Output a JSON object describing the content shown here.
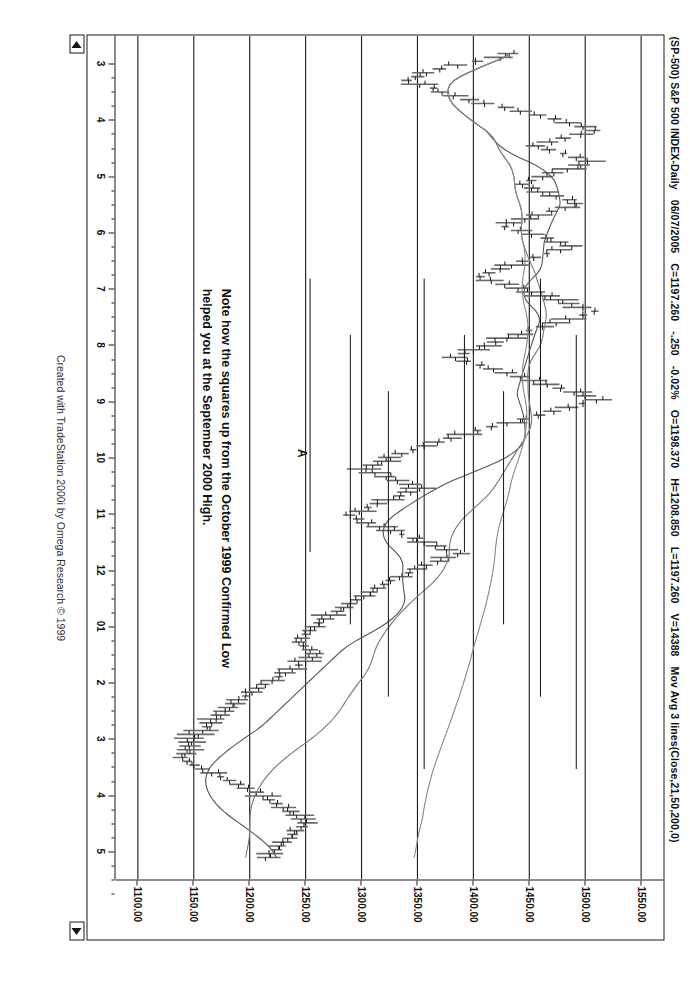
{
  "window": {
    "symbol_line": "(SP-500) S&P 500 INDEX-Daily",
    "date": "06/07/2005",
    "close_label": "C=1197.260",
    "change": "-.250",
    "change_pct": "-0.02%",
    "open_label": "O=1198.370",
    "high_label": "H=1208.850",
    "low_label": "L=1197.260",
    "volume_label": "V=14388",
    "indicator_label": "Mov Avg 3 lines(Close,21,50,200,0)"
  },
  "scroll": {
    "left_arrow": "◀",
    "right_arrow": "▶"
  },
  "annotation": {
    "line1": "Note how the squares up from the October 1999 Confirmed Low",
    "line2": "helped you at the September 2000 High.",
    "pivot_label": "A"
  },
  "footer": {
    "credit": "Created with TradeStation 2000i by Omega Research © 1999"
  },
  "colors": {
    "bar": "#6b6b6b",
    "ma_fast": "#555555",
    "ma_mid": "#777777",
    "ma_slow": "#888888",
    "grid": "#1a1a1a",
    "text": "#111111",
    "background": "#ffffff"
  },
  "chart_data": {
    "type": "line",
    "title": "(SP-500) S&P 500 INDEX-Daily",
    "subtitle": "Mov Avg 3 lines(Close,21,50,200,0)",
    "xlabel": "",
    "ylabel": "",
    "grid": true,
    "legend_position": "none",
    "ylim": [
      1080,
      1570
    ],
    "y_ticks": [
      1550.0,
      1500.0,
      1450.0,
      1400.0,
      1350.0,
      1300.0,
      1250.0,
      1200.0,
      1150.0,
      1100.0
    ],
    "y_tick_labels": [
      "1550.00",
      "1500.00",
      "1450.00",
      "1400.00",
      "1350.00",
      "1300.00",
      "1250.00",
      "1200.00",
      "1150.00",
      "1100.00"
    ],
    "x_tick_labels": [
      "3",
      "4",
      "5",
      "6",
      "7",
      "8",
      "9",
      "10",
      "11",
      "12",
      "01",
      "2",
      "3",
      "4",
      "5"
    ],
    "x_tick_meaning": "month labels, monthly spacing left to right",
    "quote": {
      "date": "06/07/2005",
      "open": 1198.37,
      "high": 1208.85,
      "low": 1197.26,
      "close": 1197.26,
      "change": -0.25,
      "change_pct": -0.02,
      "volume": 14388
    },
    "series": [
      {
        "name": "Price (OHLC bars)",
        "kind": "ohlc",
        "values": [
          1432,
          1424,
          1402,
          1386,
          1370,
          1358,
          1348,
          1342,
          1352,
          1364,
          1372,
          1382,
          1396,
          1410,
          1428,
          1442,
          1460,
          1472,
          1486,
          1498,
          1508,
          1496,
          1482,
          1470,
          1458,
          1468,
          1480,
          1492,
          1502,
          1496,
          1484,
          1472,
          1462,
          1452,
          1444,
          1452,
          1462,
          1474,
          1484,
          1492,
          1482,
          1470,
          1458,
          1446,
          1436,
          1428,
          1440,
          1452,
          1466,
          1478,
          1488,
          1478,
          1466,
          1454,
          1444,
          1434,
          1424,
          1414,
          1406,
          1416,
          1428,
          1440,
          1452,
          1464,
          1476,
          1488,
          1498,
          1508,
          1498,
          1486,
          1474,
          1462,
          1450,
          1440,
          1430,
          1420,
          1410,
          1400,
          1392,
          1384,
          1394,
          1406,
          1418,
          1430,
          1442,
          1454,
          1466,
          1478,
          1490,
          1500,
          1510,
          1498,
          1486,
          1472,
          1458,
          1444,
          1430,
          1416,
          1404,
          1392,
          1380,
          1368,
          1356,
          1346,
          1336,
          1326,
          1318,
          1310,
          1304,
          1312,
          1322,
          1332,
          1342,
          1352,
          1344,
          1334,
          1324,
          1314,
          1306,
          1298,
          1290,
          1296,
          1306,
          1316,
          1326,
          1336,
          1346,
          1356,
          1366,
          1376,
          1386,
          1378,
          1368,
          1358,
          1350,
          1342,
          1334,
          1326,
          1320,
          1314,
          1308,
          1302,
          1296,
          1290,
          1284,
          1278,
          1272,
          1266,
          1262,
          1258,
          1254,
          1250,
          1246,
          1244,
          1248,
          1254,
          1260,
          1256,
          1250,
          1244,
          1238,
          1232,
          1226,
          1220,
          1214,
          1208,
          1202,
          1196,
          1190,
          1186,
          1182,
          1178,
          1174,
          1170,
          1166,
          1162,
          1158,
          1154,
          1150,
          1148,
          1146,
          1144,
          1142,
          1140,
          1144,
          1150,
          1158,
          1166,
          1174,
          1182,
          1190,
          1198,
          1206,
          1212,
          1218,
          1224,
          1230,
          1236,
          1242,
          1246,
          1250,
          1246,
          1242,
          1238,
          1234,
          1230,
          1226,
          1222,
          1218,
          1214
        ]
      },
      {
        "name": "Mov Avg 21",
        "kind": "line",
        "period": 21
      },
      {
        "name": "Mov Avg 50",
        "kind": "line",
        "period": 50
      },
      {
        "name": "Mov Avg 200",
        "kind": "line",
        "period": 200
      }
    ],
    "horizontal_levels": [
      {
        "price": 1254,
        "label": "square-up level"
      },
      {
        "price": 1290,
        "label": "square-up level"
      },
      {
        "price": 1324,
        "label": "square-up level"
      },
      {
        "price": 1356,
        "label": "square-up level"
      },
      {
        "price": 1392,
        "label": "square-up level"
      },
      {
        "price": 1427,
        "label": "square-up level"
      },
      {
        "price": 1460,
        "label": "square-up level"
      },
      {
        "price": 1492,
        "label": "square-up level"
      }
    ],
    "annotations": [
      {
        "text": "Note how the squares up from the October 1999 Confirmed Low helped you at the September 2000 High."
      },
      {
        "text": "A",
        "meaning": "pivot marker"
      }
    ]
  }
}
